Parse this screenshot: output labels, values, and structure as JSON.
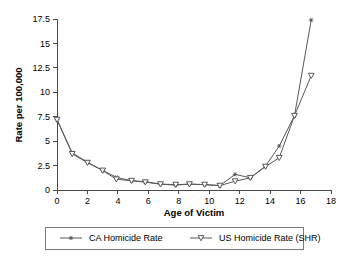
{
  "chart_data": {
    "type": "line",
    "title": "",
    "xlabel": "Age of Victim",
    "ylabel": "Rate per 100,000",
    "xlim": [
      0,
      18
    ],
    "ylim": [
      0,
      17.5
    ],
    "grid": false,
    "legend_position": "bottom",
    "xticks": [
      "0",
      "2",
      "4",
      "6",
      "8",
      "10",
      "12",
      "14",
      "16",
      "18"
    ],
    "xtick_values": [
      0,
      2,
      4,
      6,
      8,
      10,
      12,
      14,
      16,
      18
    ],
    "yticks": [
      "0",
      "2.5",
      "5",
      "7.5",
      "10",
      "12.5",
      "15",
      "17.5"
    ],
    "ytick_values": [
      0,
      2.5,
      5,
      7.5,
      10,
      12.5,
      15,
      17.5
    ],
    "series": [
      {
        "name": "CA Homicide Rate",
        "marker": "star",
        "x": [
          0.0,
          1.0,
          2.0,
          3.0,
          3.9,
          4.9,
          5.8,
          6.8,
          7.8,
          8.7,
          9.7,
          10.7,
          11.7,
          12.7,
          13.7,
          14.6,
          15.6,
          16.7
        ],
        "y": [
          7.2,
          3.8,
          2.85,
          2.0,
          1.3,
          0.95,
          0.85,
          0.6,
          0.5,
          0.6,
          0.55,
          0.45,
          1.6,
          1.25,
          2.45,
          4.5,
          7.6,
          17.4
        ]
      },
      {
        "name": "US Homicide Rate (SHR)",
        "marker": "triangle-down",
        "x": [
          0.0,
          1.0,
          2.0,
          3.0,
          3.9,
          4.9,
          5.8,
          6.8,
          7.8,
          8.7,
          9.7,
          10.7,
          11.7,
          12.7,
          13.7,
          14.6,
          15.6,
          16.7
        ],
        "y": [
          7.2,
          3.7,
          2.8,
          2.0,
          1.1,
          0.95,
          0.8,
          0.6,
          0.55,
          0.6,
          0.55,
          0.45,
          0.9,
          1.25,
          2.4,
          3.3,
          7.6,
          11.7
        ]
      }
    ],
    "legend": [
      {
        "label": "CA Homicide Rate",
        "marker": "star"
      },
      {
        "label": "US Homicide Rate (SHR)",
        "marker": "triangle-down"
      }
    ],
    "colors": {
      "line": "#595959",
      "axis": "#4a4a4a",
      "text": "#000000",
      "marker_fill": "#ffffff",
      "legend_border": "#7a7a7a",
      "background": "#ffffff"
    }
  }
}
